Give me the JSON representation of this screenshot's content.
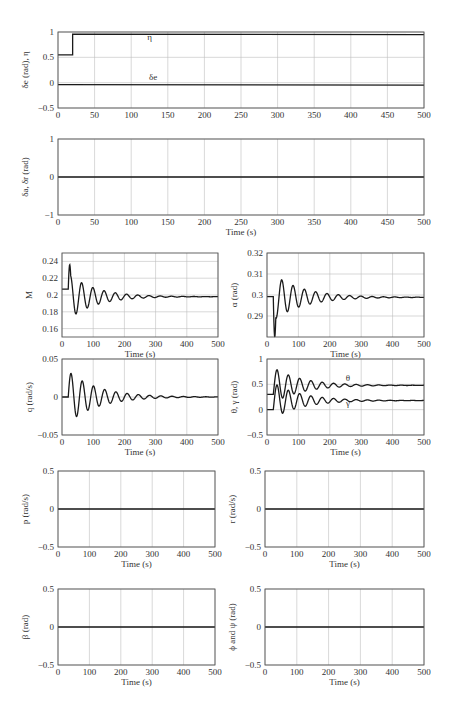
{
  "chart_data": [
    {
      "id": "elevator-throttle",
      "type": "line",
      "title": "",
      "xlabel": "",
      "ylabel": "δe (rad), η",
      "xlim": [
        0,
        500
      ],
      "ylim": [
        -0.5,
        1
      ],
      "xticks": [
        0,
        50,
        100,
        150,
        200,
        250,
        300,
        350,
        400,
        450,
        500
      ],
      "yticks": [
        -0.5,
        0,
        0.5,
        1
      ],
      "ytick_labels": [
        "−0.5",
        "0",
        "0.5",
        "1"
      ],
      "grid": true,
      "annotations": [
        {
          "text": "η",
          "x": 125,
          "y": 0.84
        },
        {
          "text": "δe",
          "x": 130,
          "y": 0.06
        }
      ],
      "series": [
        {
          "name": "η",
          "x": [
            0,
            20,
            20,
            500
          ],
          "y": [
            0.55,
            0.55,
            0.96,
            0.95
          ]
        },
        {
          "name": "δe",
          "x": [
            0,
            500
          ],
          "y": [
            -0.04,
            -0.05
          ]
        }
      ]
    },
    {
      "id": "aileron-rudder",
      "type": "line",
      "xlabel": "Time (s)",
      "ylabel": "δa, δr (rad)",
      "xlim": [
        0,
        500
      ],
      "ylim": [
        -1,
        1
      ],
      "xticks": [
        0,
        50,
        100,
        150,
        200,
        250,
        300,
        350,
        400,
        450,
        500
      ],
      "yticks": [
        -1,
        0,
        1
      ],
      "ytick_labels": [
        "−1",
        "0",
        "1"
      ],
      "grid": true,
      "series": [
        {
          "name": "δa, δr",
          "x": [
            0,
            500
          ],
          "y": [
            0,
            0
          ]
        }
      ]
    },
    {
      "id": "mach",
      "type": "line",
      "xlabel": "Time (s)",
      "ylabel": "M",
      "xlim": [
        0,
        500
      ],
      "ylim": [
        0.15,
        0.25
      ],
      "xticks": [
        0,
        100,
        200,
        300,
        400,
        500
      ],
      "yticks": [
        0.16,
        0.18,
        0.2,
        0.22,
        0.24
      ],
      "ytick_labels": [
        "0.16",
        "0.18",
        "0.2",
        "0.22",
        "0.24"
      ],
      "grid": true,
      "series": [
        {
          "name": "M",
          "model": "damped",
          "pre": 0.207,
          "t0": 20,
          "final": 0.198,
          "amp": 0.026,
          "period": 36,
          "decay": 85,
          "kick": 0.015
        }
      ]
    },
    {
      "id": "alpha",
      "type": "line",
      "xlabel": "Time (s)",
      "ylabel": "α (rad)",
      "xlim": [
        0,
        500
      ],
      "ylim": [
        0.28,
        0.32
      ],
      "xticks": [
        0,
        100,
        200,
        300,
        400,
        500
      ],
      "yticks": [
        0.29,
        0.3,
        0.31,
        0.32
      ],
      "ytick_labels": [
        "0.29",
        "0.3",
        "0.31",
        "0.32"
      ],
      "grid": true,
      "series": [
        {
          "name": "α",
          "model": "damped",
          "pre": 0.2992,
          "t0": 20,
          "final": 0.2989,
          "amp": -0.011,
          "period": 36,
          "decay": 95,
          "kick": -0.012
        }
      ]
    },
    {
      "id": "pitch-rate",
      "type": "line",
      "xlabel": "Time (s)",
      "ylabel": "q (rad/s)",
      "xlim": [
        0,
        500
      ],
      "ylim": [
        -0.05,
        0.05
      ],
      "xticks": [
        0,
        100,
        200,
        300,
        400,
        500
      ],
      "yticks": [
        -0.05,
        0,
        0.05
      ],
      "ytick_labels": [
        "−0.05",
        "0",
        "0.05"
      ],
      "grid": true,
      "series": [
        {
          "name": "q",
          "model": "damped_sin",
          "pre": 0,
          "t0": 20,
          "final": 0,
          "amp": 0.034,
          "period": 36,
          "decay": 95
        }
      ]
    },
    {
      "id": "theta-gamma",
      "type": "line",
      "xlabel": "Time (s)",
      "ylabel": "θ, γ (rad)",
      "xlim": [
        0,
        500
      ],
      "ylim": [
        -0.5,
        1
      ],
      "xticks": [
        0,
        100,
        200,
        300,
        400,
        500
      ],
      "yticks": [
        -0.5,
        0,
        0.5,
        1
      ],
      "ytick_labels": [
        "−0.5",
        "0",
        "0.5",
        "1"
      ],
      "grid": true,
      "annotations": [
        {
          "text": "θ",
          "x": 258,
          "y": 0.56
        },
        {
          "text": "γ",
          "x": 258,
          "y": 0.08
        }
      ],
      "series": [
        {
          "name": "θ",
          "model": "damped_rise",
          "pre": 0.3,
          "t0": 20,
          "final": 0.48,
          "amp": 0.3,
          "period": 36,
          "decay": 90
        },
        {
          "name": "γ",
          "model": "damped_rise",
          "pre": 0.0,
          "t0": 20,
          "final": 0.18,
          "amp": 0.3,
          "period": 36,
          "decay": 90
        }
      ]
    },
    {
      "id": "roll-rate",
      "type": "line",
      "xlabel": "Time (s)",
      "ylabel": "p (rad/s)",
      "xlim": [
        0,
        500
      ],
      "ylim": [
        -0.5,
        0.5
      ],
      "xticks": [
        0,
        100,
        200,
        300,
        400,
        500
      ],
      "yticks": [
        -0.5,
        0,
        0.5
      ],
      "ytick_labels": [
        "−0.5",
        "0",
        "0.5"
      ],
      "grid": true,
      "series": [
        {
          "name": "p",
          "x": [
            0,
            500
          ],
          "y": [
            0,
            0
          ]
        }
      ]
    },
    {
      "id": "yaw-rate",
      "type": "line",
      "xlabel": "Time (s)",
      "ylabel": "r (rad/s)",
      "xlim": [
        0,
        500
      ],
      "ylim": [
        -0.5,
        0.5
      ],
      "xticks": [
        0,
        100,
        200,
        300,
        400,
        500
      ],
      "yticks": [
        -0.5,
        0,
        0.5
      ],
      "ytick_labels": [
        "−0.5",
        "0",
        "0.5"
      ],
      "grid": true,
      "series": [
        {
          "name": "r",
          "x": [
            0,
            500
          ],
          "y": [
            0,
            0
          ]
        }
      ]
    },
    {
      "id": "sideslip",
      "type": "line",
      "xlabel": "Time (s)",
      "ylabel": "β (rad)",
      "xlim": [
        0,
        500
      ],
      "ylim": [
        -0.5,
        0.5
      ],
      "xticks": [
        0,
        100,
        200,
        300,
        400,
        500
      ],
      "yticks": [
        -0.5,
        0,
        0.5
      ],
      "ytick_labels": [
        "−0.5",
        "0",
        "0.5"
      ],
      "grid": true,
      "series": [
        {
          "name": "β",
          "x": [
            0,
            500
          ],
          "y": [
            0,
            0
          ]
        }
      ]
    },
    {
      "id": "bank-heading",
      "type": "line",
      "xlabel": "Time (s)",
      "ylabel": "ϕ and ψ (rad)",
      "xlim": [
        0,
        500
      ],
      "ylim": [
        -0.5,
        0.5
      ],
      "xticks": [
        0,
        100,
        200,
        300,
        400,
        500
      ],
      "yticks": [
        -0.5,
        0,
        0.5
      ],
      "ytick_labels": [
        "−0.5",
        "0",
        "0.5"
      ],
      "grid": true,
      "series": [
        {
          "name": "ϕ and ψ",
          "x": [
            0,
            500
          ],
          "y": [
            0,
            0
          ]
        }
      ]
    }
  ],
  "layout": {
    "panels": [
      {
        "x": 58,
        "y": 32,
        "w": 366,
        "h": 76
      },
      {
        "x": 58,
        "y": 139,
        "w": 366,
        "h": 76
      },
      {
        "x": 62,
        "y": 253,
        "w": 156,
        "h": 84
      },
      {
        "x": 267,
        "y": 253,
        "w": 157,
        "h": 84
      },
      {
        "x": 62,
        "y": 359,
        "w": 156,
        "h": 76
      },
      {
        "x": 267,
        "y": 359,
        "w": 157,
        "h": 76
      },
      {
        "x": 58,
        "y": 471,
        "w": 157,
        "h": 76
      },
      {
        "x": 265,
        "y": 471,
        "w": 159,
        "h": 76
      },
      {
        "x": 58,
        "y": 589,
        "w": 157,
        "h": 76
      },
      {
        "x": 265,
        "y": 589,
        "w": 159,
        "h": 76
      }
    ],
    "colors": {
      "line": "#1a1a1a",
      "grid": "#bdbdbd",
      "axis": "#555555",
      "text": "#333333"
    }
  }
}
